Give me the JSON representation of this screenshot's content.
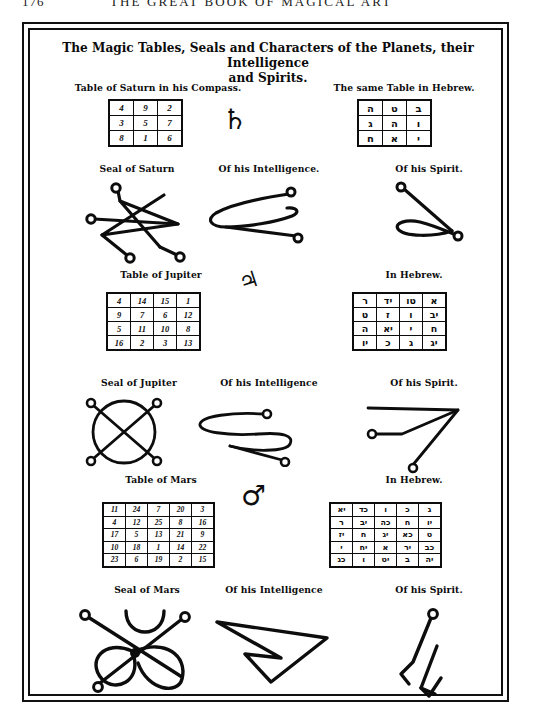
{
  "running_head": {
    "folio": "176",
    "title": "THE GREAT BOOK OF MAGICAL ART"
  },
  "plate": {
    "title_line1": "The Magic Tables, Seals and Characters of the Planets, their Intelligence",
    "title_line2": "and Spirits."
  },
  "sections": [
    {
      "planet": "Saturn",
      "planet_symbol": "♄",
      "table_caption": "Table of Saturn in his Compass.",
      "hebrew_caption": "The same Table in Hebrew.",
      "square": {
        "order": 3,
        "rows": [
          [
            "4",
            "9",
            "2"
          ],
          [
            "3",
            "5",
            "7"
          ],
          [
            "8",
            "1",
            "6"
          ]
        ]
      },
      "hebrew_square": {
        "order": 3,
        "rows": [
          [
            "ה",
            "ט",
            "ב"
          ],
          [
            "ג",
            "ה",
            "ו"
          ],
          [
            "ח",
            "א",
            "י"
          ]
        ]
      },
      "seal_caption": "Seal of Saturn",
      "intelligence_caption": "Of his Intelligence.",
      "spirit_caption": "Of his Spirit."
    },
    {
      "planet": "Jupiter",
      "planet_symbol": "♃",
      "table_caption": "Table of Jupiter",
      "hebrew_caption": "In Hebrew.",
      "square": {
        "order": 4,
        "rows": [
          [
            "4",
            "14",
            "15",
            "1"
          ],
          [
            "9",
            "7",
            "6",
            "12"
          ],
          [
            "5",
            "11",
            "10",
            "8"
          ],
          [
            "16",
            "2",
            "3",
            "13"
          ]
        ]
      },
      "hebrew_square": {
        "order": 4,
        "rows": [
          [
            "ר",
            "יד",
            "טו",
            "א"
          ],
          [
            "ט",
            "ז",
            "ו",
            "יב"
          ],
          [
            "ה",
            "יא",
            "י",
            "ח"
          ],
          [
            "יו",
            "כ",
            "ג",
            "יג"
          ]
        ]
      },
      "seal_caption": "Seal of Jupiter",
      "intelligence_caption": "Of his Intelligence",
      "spirit_caption": "Of his Spirit."
    },
    {
      "planet": "Mars",
      "planet_symbol": "♂",
      "table_caption": "Table of Mars",
      "hebrew_caption": "In Hebrew.",
      "square": {
        "order": 5,
        "rows": [
          [
            "11",
            "24",
            "7",
            "20",
            "3"
          ],
          [
            "4",
            "12",
            "25",
            "8",
            "16"
          ],
          [
            "17",
            "5",
            "13",
            "21",
            "9"
          ],
          [
            "10",
            "18",
            "1",
            "14",
            "22"
          ],
          [
            "23",
            "6",
            "19",
            "2",
            "15"
          ]
        ]
      },
      "hebrew_square": {
        "order": 5,
        "rows": [
          [
            "יא",
            "כד",
            "ו",
            "כ",
            "ג"
          ],
          [
            "ר",
            "יב",
            "כה",
            "ח",
            "יו"
          ],
          [
            "יז",
            "ח",
            "יג",
            "כא",
            "ט"
          ],
          [
            "י",
            "יח",
            "א",
            "יר",
            "כב"
          ],
          [
            "כג",
            "ו",
            "יט",
            "ב",
            "יה"
          ]
        ]
      },
      "seal_caption": "Seal of Mars",
      "intelligence_caption": "Of his Intelligence",
      "spirit_caption": "Of his Spirit."
    }
  ],
  "colors": {
    "ink": "#0d0d0d",
    "paper": "#ffffff"
  }
}
